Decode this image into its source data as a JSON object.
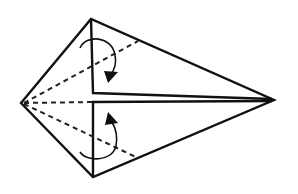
{
  "diagram": {
    "type": "origami-fold-instruction",
    "colors": {
      "stroke": "#111111",
      "background": "#ffffff"
    },
    "vertices": {
      "left": [
        21,
        103
      ],
      "top": [
        91,
        19
      ],
      "right": [
        274,
        100
      ],
      "bottom": [
        93,
        177
      ]
    },
    "folds": [
      {
        "name": "upper-valley-fold",
        "from": [
          24,
          103
        ],
        "to": [
          138,
          41
        ],
        "style": "dashed"
      },
      {
        "name": "center-crease",
        "from": [
          24,
          103
        ],
        "to": [
          93,
          101
        ],
        "style": "dashed"
      },
      {
        "name": "lower-valley-fold",
        "from": [
          24,
          103
        ],
        "to": [
          138,
          158
        ],
        "style": "dashed"
      }
    ],
    "arrows": [
      {
        "name": "upper-fold-arrow",
        "direction": "down"
      },
      {
        "name": "lower-fold-arrow",
        "direction": "up"
      }
    ]
  }
}
